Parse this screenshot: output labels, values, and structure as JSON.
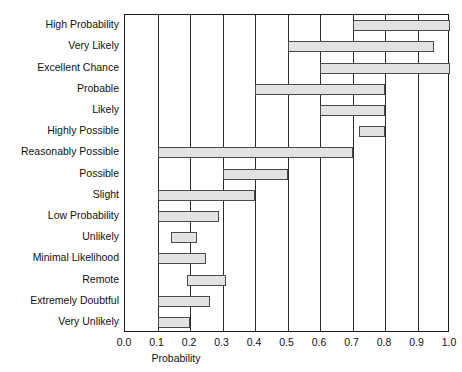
{
  "figure": {
    "clipped_top_text": "",
    "background_color": "#ffffff"
  },
  "chart_data": {
    "type": "bar",
    "orientation": "horizontal",
    "subtype": "range-bar",
    "title": "",
    "xlabel": "Probability",
    "ylabel": "",
    "xlim": [
      0.0,
      1.0
    ],
    "grid": "vertical gridlines at every 0.1",
    "legend": "none",
    "bar_fill_color": "#e2e2e2",
    "bar_edge_color": "#4a4a4a",
    "xticks": [
      "0.0",
      "0.1",
      "0.2",
      "0.3",
      "0.4",
      "0.5",
      "0.6",
      "0.7",
      "0.8",
      "0.9",
      "1.0"
    ],
    "xtick_values": [
      0.0,
      0.1,
      0.2,
      0.3,
      0.4,
      0.5,
      0.6,
      0.7,
      0.8,
      0.9,
      1.0
    ],
    "categories": [
      "High Probability",
      "Very Likely",
      "Excellent Chance",
      "Probable",
      "Likely",
      "Highly Possible",
      "Reasonably Possible",
      "Possible",
      "Slight",
      "Low Probability",
      "Unlikely",
      "Minimal Likelihood",
      "Remote",
      "Extremely Doubtful",
      "Very Unlikely"
    ],
    "bars": [
      {
        "label": "High Probability",
        "start": 0.7,
        "end": 1.0
      },
      {
        "label": "Very Likely",
        "start": 0.5,
        "end": 0.95
      },
      {
        "label": "Excellent Chance",
        "start": 0.6,
        "end": 1.0
      },
      {
        "label": "Probable",
        "start": 0.4,
        "end": 0.8
      },
      {
        "label": "Likely",
        "start": 0.6,
        "end": 0.8
      },
      {
        "label": "Highly Possible",
        "start": 0.72,
        "end": 0.8
      },
      {
        "label": "Reasonably Possible",
        "start": 0.1,
        "end": 0.7
      },
      {
        "label": "Possible",
        "start": 0.3,
        "end": 0.5
      },
      {
        "label": "Slight",
        "start": 0.1,
        "end": 0.4
      },
      {
        "label": "Low Probability",
        "start": 0.1,
        "end": 0.29
      },
      {
        "label": "Unlikely",
        "start": 0.14,
        "end": 0.22
      },
      {
        "label": "Minimal Likelihood",
        "start": 0.1,
        "end": 0.25
      },
      {
        "label": "Remote",
        "start": 0.19,
        "end": 0.31
      },
      {
        "label": "Extremely Doubtful",
        "start": 0.1,
        "end": 0.26
      },
      {
        "label": "Very Unlikely",
        "start": 0.1,
        "end": 0.2
      }
    ]
  }
}
